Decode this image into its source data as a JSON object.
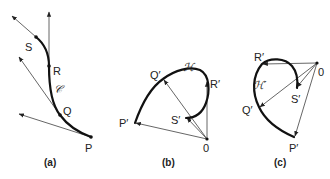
{
  "figure": {
    "panels": [
      {
        "id": "a",
        "caption": "(a)",
        "curve_label": "𝒞",
        "points": [
          {
            "name": "P",
            "label": "P"
          },
          {
            "name": "Q",
            "label": "Q"
          },
          {
            "name": "R",
            "label": "R"
          },
          {
            "name": "S",
            "label": "S"
          }
        ],
        "description": "Curve C with tangent vectors at points P, Q, R, S"
      },
      {
        "id": "b",
        "caption": "(b)",
        "curve_label": "ℋ",
        "origin_label": "0",
        "points": [
          {
            "name": "P'",
            "label": "P′"
          },
          {
            "name": "Q'",
            "label": "Q′"
          },
          {
            "name": "R'",
            "label": "R′"
          },
          {
            "name": "S'",
            "label": "S′"
          }
        ],
        "description": "Hodograph H: tangent vectors drawn from origin 0"
      },
      {
        "id": "c",
        "caption": "(c)",
        "curve_label": "ℋ′",
        "origin_label": "0",
        "points": [
          {
            "name": "P'",
            "label": "P′"
          },
          {
            "name": "Q'",
            "label": "Q′"
          },
          {
            "name": "R'",
            "label": "R′"
          },
          {
            "name": "S'",
            "label": "S′"
          }
        ],
        "description": "Hodograph H′ with vectors drawn from origin 0"
      }
    ]
  }
}
